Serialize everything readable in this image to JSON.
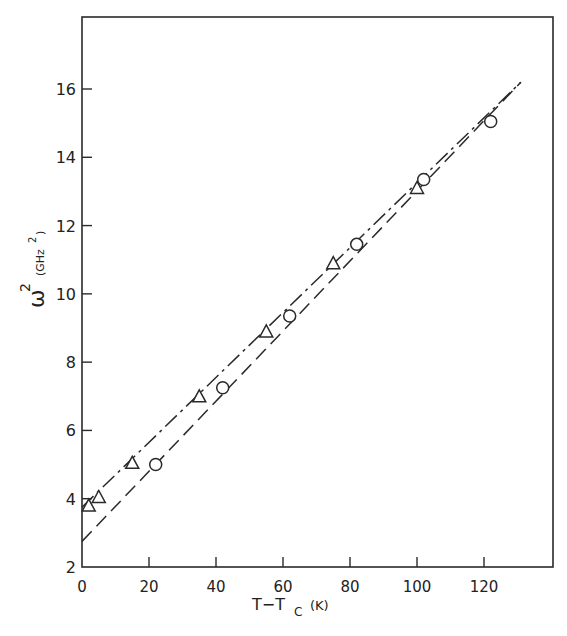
{
  "chart_data": {
    "type": "scatter",
    "title": "",
    "xlabel": "T−T_C (K)",
    "ylabel": "ω² (GHz²)",
    "xlim": [
      0,
      140
    ],
    "ylim": [
      2,
      18
    ],
    "xticks": [
      0,
      20,
      40,
      60,
      80,
      100,
      120
    ],
    "yticks": [
      2,
      4,
      6,
      8,
      10,
      12,
      14,
      16
    ],
    "grid": false,
    "legend": null,
    "series": [
      {
        "name": "triangles",
        "marker": "triangle",
        "x": [
          2,
          5,
          15,
          35,
          55,
          75,
          100
        ],
        "y": [
          3.8,
          4.05,
          5.05,
          7.0,
          8.9,
          10.9,
          13.1
        ]
      },
      {
        "name": "circles",
        "marker": "circle",
        "x": [
          22,
          42,
          62,
          82,
          102,
          122
        ],
        "y": [
          5.0,
          7.25,
          9.35,
          11.45,
          13.35,
          15.05
        ]
      }
    ],
    "fit_lines": [
      {
        "name": "dash-dot fit (triangles)",
        "style": "dash-dot",
        "x": [
          0,
          131
        ],
        "y": [
          3.75,
          16.2
        ]
      },
      {
        "name": "dashed fit (circles)",
        "style": "dashed",
        "x": [
          0,
          131
        ],
        "y": [
          2.75,
          16.2
        ]
      }
    ]
  },
  "labels": {
    "x_title_main": "T−T",
    "x_title_sub": "C",
    "x_title_unit": "(K)",
    "y_title_main": "ω",
    "y_title_sup": "2",
    "y_title_unit": "(GHz",
    "y_title_unit_sup": "2",
    "y_title_unit_close": ")"
  }
}
